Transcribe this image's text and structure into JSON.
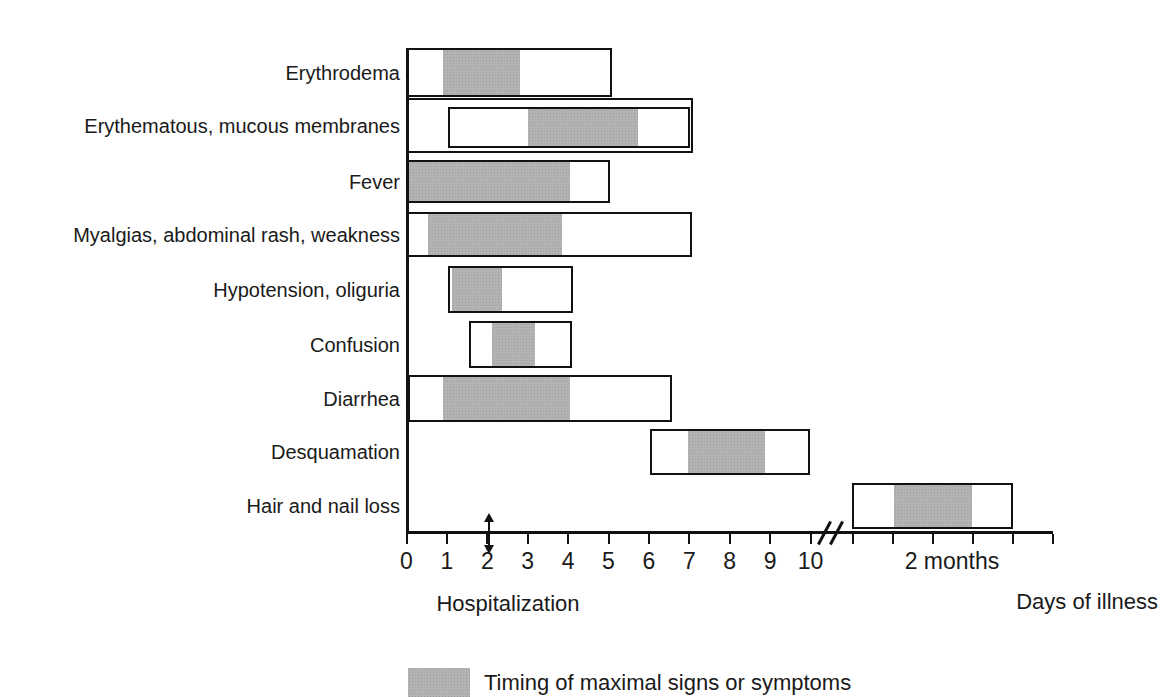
{
  "figure": {
    "background_color": "#ffffff",
    "text_color": "#1a1a1a",
    "line_color": "#111111",
    "maximal_fill_color": "#b3b3b3"
  },
  "chart_data": {
    "type": "bar",
    "subtype": "gantt-timeline",
    "title": "",
    "xlabel": "Days of illness",
    "ylabel": "",
    "x_axis": {
      "unit": "days",
      "tick_labels": [
        "0",
        "1",
        "2",
        "3",
        "4",
        "5",
        "6",
        "7",
        "8",
        "9",
        "10"
      ],
      "tick_days": [
        0,
        1,
        2,
        3,
        4,
        5,
        6,
        7,
        8,
        9,
        10
      ],
      "break_after_day": 10,
      "break_pseudo_day": 10.48,
      "post_break_tick_pseudo_days": [
        11.05,
        12.04,
        13.03,
        14.02,
        15.01,
        16.0
      ],
      "post_break_label": "2 months",
      "post_break_label_center_pseudo_day": 13.5,
      "axis_title": "Days of illness"
    },
    "rows": [
      {
        "label": "Erythrodema",
        "duration_days": [
          0,
          5.09
        ],
        "maximal_days": [
          0.9,
          2.81
        ]
      },
      {
        "label": "Erythematous, mucous membranes",
        "outer_duration_days": [
          0,
          7.1
        ],
        "duration_days": [
          1.03,
          7.02
        ],
        "maximal_days": [
          3.0,
          5.73
        ]
      },
      {
        "label": "Fever",
        "duration_days": [
          0,
          5.04
        ],
        "maximal_days": [
          0,
          4.0
        ]
      },
      {
        "label": "Myalgias, abdominal rash, weakness",
        "duration_days": [
          0,
          7.07
        ],
        "maximal_days": [
          0.53,
          3.85
        ]
      },
      {
        "label": "Hypotension, oliguria",
        "duration_days": [
          1.03,
          4.12
        ],
        "maximal_days": [
          1.13,
          2.36
        ]
      },
      {
        "label": "Confusion",
        "duration_days": [
          1.55,
          4.1
        ],
        "maximal_days": [
          2.12,
          3.18
        ]
      },
      {
        "label": "Diarrhea",
        "duration_days": [
          0.04,
          6.57
        ],
        "maximal_days": [
          0.9,
          4.05
        ]
      },
      {
        "label": "Desquamation",
        "duration_days": [
          6.03,
          9.99
        ],
        "maximal_days": [
          6.97,
          8.87
        ]
      },
      {
        "label": "Hair and nail loss",
        "duration_days": [
          11.03,
          15.01
        ],
        "maximal_days": [
          12.07,
          14.0
        ],
        "after_break": true,
        "approx_time": "about 2 months"
      }
    ],
    "annotations": {
      "hospitalization": {
        "label": "Hospitalization",
        "day": 2,
        "marker": "double-headed-vertical-arrow"
      }
    },
    "legend": {
      "label": "Timing of maximal signs or symptoms",
      "position": "bottom-center"
    },
    "grid": false
  }
}
